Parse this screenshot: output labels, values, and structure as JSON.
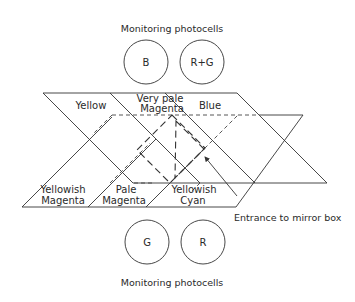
{
  "diagram": {
    "top_photocells": {
      "title": "Monitoring photocells",
      "cells": [
        {
          "label": "B"
        },
        {
          "label": "R+G"
        }
      ]
    },
    "bottom_photocells": {
      "title": "Monitoring photocells",
      "cells": [
        {
          "label": "G"
        },
        {
          "label": "R"
        }
      ]
    },
    "upper_regions": [
      {
        "line1": "Yellow",
        "line2": ""
      },
      {
        "line1": "Very pale",
        "line2": "Magenta"
      },
      {
        "line1": "Blue",
        "line2": ""
      }
    ],
    "lower_regions": [
      {
        "line1": "Yellowish",
        "line2": "Magenta"
      },
      {
        "line1": "Pale",
        "line2": "Magenta"
      },
      {
        "line1": "Yellowish",
        "line2": "Cyan"
      }
    ],
    "annotation": "Entrance to mirror box"
  }
}
